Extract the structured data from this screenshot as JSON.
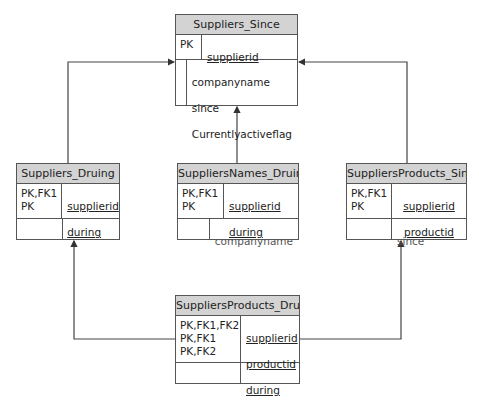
{
  "entities": {
    "suppliers_since": {
      "title": "Suppliers_Since",
      "key_labels": "PK",
      "key_fields": [
        "supplierid"
      ],
      "attr_labels": "",
      "attributes": [
        "companyname",
        "since",
        "Currentlyactiveflag"
      ]
    },
    "suppliers_during": {
      "title": "Suppliers_Druing",
      "key_labels": "PK,FK1\nPK",
      "key_fields": [
        "supplierid",
        "during"
      ],
      "attr_labels": "",
      "attributes": []
    },
    "suppliernames_during": {
      "title": "SuppliersNames_Druing",
      "key_labels": "PK,FK1\nPK",
      "key_fields": [
        "supplierid",
        "during"
      ],
      "attr_labels": "",
      "attributes": [
        "companyname"
      ]
    },
    "supplierproducts_since": {
      "title": "SuppliersProducts_Since",
      "key_labels": "PK,FK1\nPK",
      "key_fields": [
        "supplierid",
        "productid"
      ],
      "attr_labels": "",
      "attributes": [
        "since"
      ]
    },
    "supplierproducts_during": {
      "title": "SuppliersProducts_Druing",
      "key_labels": "PK,FK1,FK2\nPK,FK1\nPK,FK2",
      "key_fields": [
        "supplierid",
        "productid",
        "during"
      ],
      "attr_labels": "",
      "attributes": []
    }
  },
  "relationships": [
    {
      "from": "Suppliers_Druing",
      "to": "Suppliers_Since"
    },
    {
      "from": "SuppliersNames_Druing",
      "to": "Suppliers_Since"
    },
    {
      "from": "SuppliersProducts_Since",
      "to": "Suppliers_Since"
    },
    {
      "from": "SuppliersProducts_Druing",
      "to": "Suppliers_Druing"
    },
    {
      "from": "SuppliersProducts_Druing",
      "to": "SuppliersProducts_Since"
    }
  ]
}
